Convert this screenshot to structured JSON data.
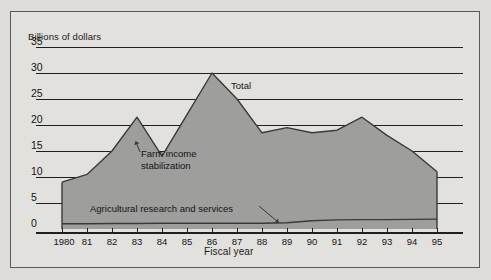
{
  "figure": {
    "y_axis_title": "Billions of dollars",
    "x_axis_title": "Fiscal year",
    "background_color": "#e3e1dd",
    "page_color": "#dedcd8",
    "area_fill_color": "#9e9e9c",
    "line_color": "#3a3a3c",
    "grid_color": "#1f1f21",
    "border_color": "#59585a"
  },
  "labels": {
    "total": "Total",
    "farm_income_line1": "Farm income",
    "farm_income_line2": "stabilization",
    "agricultural": "Agricultural  research and services"
  },
  "chart_data": {
    "type": "area",
    "title": "",
    "subtitle": "",
    "xlabel": "Fiscal year",
    "ylabel": "Billions of dollars",
    "ylim": [
      0,
      35
    ],
    "xlim": [
      1980,
      1995
    ],
    "grid": true,
    "legend": "inline-annotations",
    "y_ticks": [
      0,
      5,
      10,
      15,
      20,
      25,
      30,
      35
    ],
    "y_tick_labels": [
      "0",
      "5",
      "10",
      "15",
      "20",
      "25",
      "30",
      "35"
    ],
    "x": [
      1980,
      1981,
      1982,
      1983,
      1984,
      1985,
      1986,
      1987,
      1988,
      1989,
      1990,
      1991,
      1992,
      1993,
      1994,
      1995
    ],
    "x_tick_labels": [
      "1980",
      "81",
      "82",
      "83",
      "84",
      "85",
      "86",
      "87",
      "88",
      "89",
      "90",
      "91",
      "92",
      "93",
      "94",
      "95"
    ],
    "series": [
      {
        "name": "Total",
        "values": [
          9.0,
          10.5,
          15.0,
          21.5,
          14.0,
          22.0,
          30.0,
          25.0,
          18.5,
          19.5,
          18.5,
          19.0,
          21.5,
          18.0,
          15.0,
          11.0
        ]
      },
      {
        "name": "Agricultural  research and services",
        "values": [
          1.0,
          1.0,
          1.05,
          1.05,
          1.1,
          1.1,
          1.1,
          1.1,
          1.1,
          1.2,
          1.6,
          1.75,
          1.8,
          1.8,
          1.85,
          1.9
        ]
      }
    ],
    "annotations": [
      {
        "text": "Total",
        "x": 1987.0,
        "y": 26.5
      },
      {
        "text": "Farm income stabilization",
        "x": 1984.4,
        "y": 14.5
      },
      {
        "text": "Agricultural  research and services",
        "x": 1983.0,
        "y": 2.2,
        "pointer_to_x": 1988.6,
        "pointer_to_y": 1.1
      }
    ]
  }
}
